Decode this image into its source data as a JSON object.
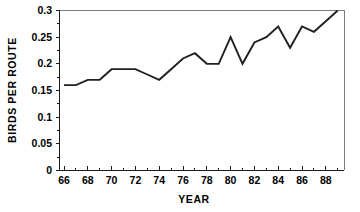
{
  "chart_data": {
    "type": "line",
    "title": "",
    "xlabel": "YEAR",
    "ylabel": "BIRDS PER ROUTE",
    "x": [
      66,
      67,
      68,
      69,
      70,
      71,
      72,
      73,
      74,
      75,
      76,
      77,
      78,
      79,
      80,
      81,
      82,
      83,
      84,
      85,
      86,
      87,
      88,
      89
    ],
    "values": [
      0.16,
      0.16,
      0.17,
      0.17,
      0.19,
      0.19,
      0.19,
      0.18,
      0.17,
      0.19,
      0.21,
      0.22,
      0.2,
      0.2,
      0.25,
      0.2,
      0.24,
      0.25,
      0.27,
      0.23,
      0.27,
      0.26,
      0.28,
      0.3
    ],
    "series": [
      {
        "name": "Birds per route",
        "values": [
          0.16,
          0.16,
          0.17,
          0.17,
          0.19,
          0.19,
          0.19,
          0.18,
          0.17,
          0.19,
          0.21,
          0.22,
          0.2,
          0.2,
          0.25,
          0.2,
          0.24,
          0.25,
          0.27,
          0.23,
          0.27,
          0.26,
          0.28,
          0.3
        ]
      }
    ],
    "xlim": [
      65.5,
      89.5
    ],
    "ylim": [
      0,
      0.3
    ],
    "xticks": [
      66,
      68,
      70,
      72,
      74,
      76,
      78,
      80,
      82,
      84,
      86,
      88
    ],
    "xtick_labels": [
      "66",
      "68",
      "70",
      "72",
      "74",
      "76",
      "78",
      "80",
      "82",
      "84",
      "86",
      "88"
    ],
    "x_minor_ticks": [
      67,
      69,
      71,
      73,
      75,
      77,
      79,
      81,
      83,
      85,
      87,
      89
    ],
    "yticks": [
      0,
      0.05,
      0.1,
      0.15,
      0.2,
      0.25,
      0.3
    ],
    "ytick_labels": [
      "0",
      "0.05",
      "0.1",
      "0.15",
      "0.2",
      "0.25",
      "0.3"
    ],
    "grid": false,
    "legend": false,
    "legend_position": "none",
    "line_color": "#202020",
    "axis_color": "#1a1a1a",
    "background_color": "#ffffff"
  },
  "axes": {
    "x_title": "YEAR",
    "y_title": "BIRDS PER ROUTE"
  },
  "ytick_labels": {
    "t0": "0",
    "t1": "0.05",
    "t2": "0.1",
    "t3": "0.15",
    "t4": "0.2",
    "t5": "0.25",
    "t6": "0.3"
  },
  "xtick_labels": {
    "t0": "66",
    "t1": "68",
    "t2": "70",
    "t3": "72",
    "t4": "74",
    "t5": "76",
    "t6": "78",
    "t7": "80",
    "t8": "82",
    "t9": "84",
    "t10": "86",
    "t11": "88"
  }
}
